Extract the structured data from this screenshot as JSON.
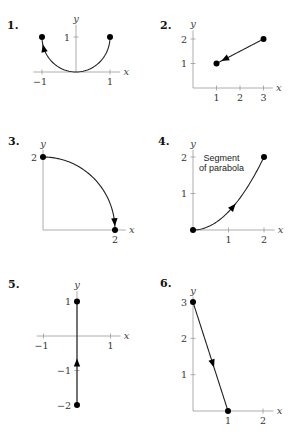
{
  "chart_data": [
    {
      "type": "line",
      "panel": "1.",
      "description": "Lower semicircle from (1,1) to (-1,1) through (0,0)",
      "curve": {
        "kind": "arc",
        "center": [
          0,
          1
        ],
        "radius": 1,
        "from_deg": 0,
        "to_deg": -180,
        "direction": "from (1,1) to (-1,1)"
      },
      "points": [
        [
          1,
          1
        ],
        [
          -1,
          1
        ]
      ],
      "arrow_at_t": 0.93,
      "xlabel": "x",
      "ylabel": "y",
      "xticks": [
        -1,
        1
      ],
      "xtick_labels": [
        "−1",
        "1"
      ],
      "yticks": [
        1
      ],
      "ytick_labels": [
        "1"
      ],
      "xlim": [
        -1.25,
        1.3
      ],
      "ylim": [
        0,
        1.35
      ]
    },
    {
      "type": "line",
      "panel": "2.",
      "description": "Line segment from (3,2) to (1,1)",
      "curve": {
        "kind": "segment",
        "from": [
          3,
          2
        ],
        "to": [
          1,
          1
        ]
      },
      "points": [
        [
          3,
          2
        ],
        [
          1,
          1
        ]
      ],
      "arrow_at_t": 0.9,
      "xlabel": "x",
      "ylabel": "y",
      "xticks": [
        1,
        2,
        3
      ],
      "xtick_labels": [
        "1",
        "2",
        "3"
      ],
      "yticks": [
        1,
        2
      ],
      "ytick_labels": [
        "1",
        "2"
      ],
      "xlim": [
        0,
        3.4
      ],
      "ylim": [
        0,
        2.35
      ]
    },
    {
      "type": "line",
      "panel": "3.",
      "description": "Quarter circle of radius 2 from (0,2) to (2,0), clockwise",
      "curve": {
        "kind": "arc",
        "center": [
          0,
          0
        ],
        "radius": 2,
        "from_deg": 90,
        "to_deg": 0,
        "direction": "from (0,2) to (2,0)"
      },
      "points": [
        [
          0,
          2
        ],
        [
          2,
          0
        ]
      ],
      "arrow_at_t": 0.96,
      "xlabel": "x",
      "ylabel": "y",
      "xticks": [
        2
      ],
      "xtick_labels": [
        "2"
      ],
      "yticks": [
        2
      ],
      "ytick_labels": [
        "2"
      ],
      "xlim": [
        0,
        2.3
      ],
      "ylim": [
        0,
        2.2
      ]
    },
    {
      "type": "line",
      "panel": "4.",
      "description": "Segment of parabola y = x^2/2 from (0,0) to (2,2)",
      "curve": {
        "kind": "parabola",
        "a": 0.5,
        "x_from": 0,
        "x_to": 2
      },
      "points": [
        [
          0,
          0
        ],
        [
          2,
          2
        ]
      ],
      "arrow_at_t": 0.6,
      "annotation": [
        "Segment",
        "of parabola"
      ],
      "xlabel": "x",
      "ylabel": "y",
      "xticks": [
        1,
        2
      ],
      "xtick_labels": [
        "1",
        "2"
      ],
      "yticks": [
        1,
        2
      ],
      "ytick_labels": [
        "1",
        "2"
      ],
      "xlim": [
        0,
        2.3
      ],
      "ylim": [
        0,
        2.2
      ]
    },
    {
      "type": "line",
      "panel": "5.",
      "description": "Vertical segment from (0,-2) to (0,1)",
      "curve": {
        "kind": "segment",
        "from": [
          0,
          -2
        ],
        "to": [
          0,
          1
        ]
      },
      "points": [
        [
          0,
          -2
        ],
        [
          0,
          1
        ]
      ],
      "arrow_at_t": 0.45,
      "xlabel": "x",
      "ylabel": "y",
      "xticks": [
        -1,
        1
      ],
      "xtick_labels": [
        "−1",
        "1"
      ],
      "yticks": [
        1,
        -1,
        -2
      ],
      "ytick_labels": [
        "1",
        "−1",
        "−2"
      ],
      "xlim": [
        -1.2,
        1.3
      ],
      "ylim": [
        -2.0,
        1.3
      ]
    },
    {
      "type": "line",
      "panel": "6.",
      "description": "Line segment from (0,3) to (1,0)",
      "curve": {
        "kind": "segment",
        "from": [
          0,
          3
        ],
        "to": [
          1,
          0
        ]
      },
      "points": [
        [
          0,
          3
        ],
        [
          1,
          0
        ]
      ],
      "arrow_at_t": 0.6,
      "xlabel": "x",
      "ylabel": "y",
      "xticks": [
        1,
        2
      ],
      "xtick_labels": [
        "1",
        "2"
      ],
      "yticks": [
        1,
        2,
        3
      ],
      "ytick_labels": [
        "1",
        "2",
        "3"
      ],
      "xlim": [
        0,
        2.3
      ],
      "ylim": [
        0,
        3.15
      ]
    }
  ]
}
